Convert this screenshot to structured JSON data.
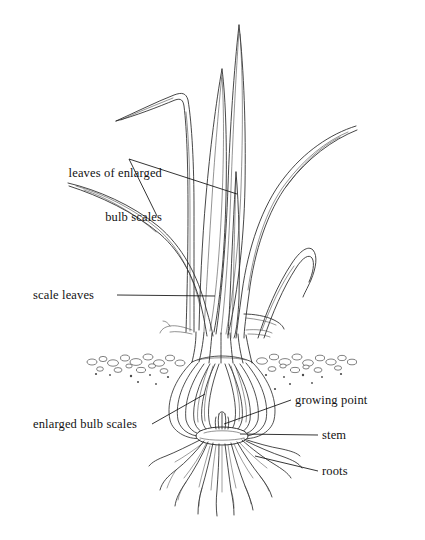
{
  "figure": {
    "style": "black-and-white line drawing",
    "background_color": "#ffffff",
    "ink_color": "#1a1a1a"
  },
  "labels": {
    "leaves_of_enlarged_bulb_scales": {
      "line1": "leaves of enlarged",
      "line2": "bulb scales"
    },
    "scale_leaves": "scale leaves",
    "enlarged_bulb_scales": "enlarged bulb scales",
    "growing_point": "growing point",
    "stem": "stem",
    "roots": "roots"
  },
  "parts": [
    {
      "name": "leaves of enlarged bulb scales",
      "region": "foliage leaves above ground"
    },
    {
      "name": "scale leaves",
      "region": "sheathing leaf bases at bulb neck"
    },
    {
      "name": "enlarged bulb scales",
      "region": "fleshy concentric scales of bulb"
    },
    {
      "name": "growing point",
      "region": "apical meristem at bulb centre"
    },
    {
      "name": "stem",
      "region": "compressed basal plate"
    },
    {
      "name": "roots",
      "region": "adventitious fibrous roots"
    }
  ],
  "soil_line": {
    "description": "stippled gravel band marking the soil surface",
    "y": 358
  }
}
